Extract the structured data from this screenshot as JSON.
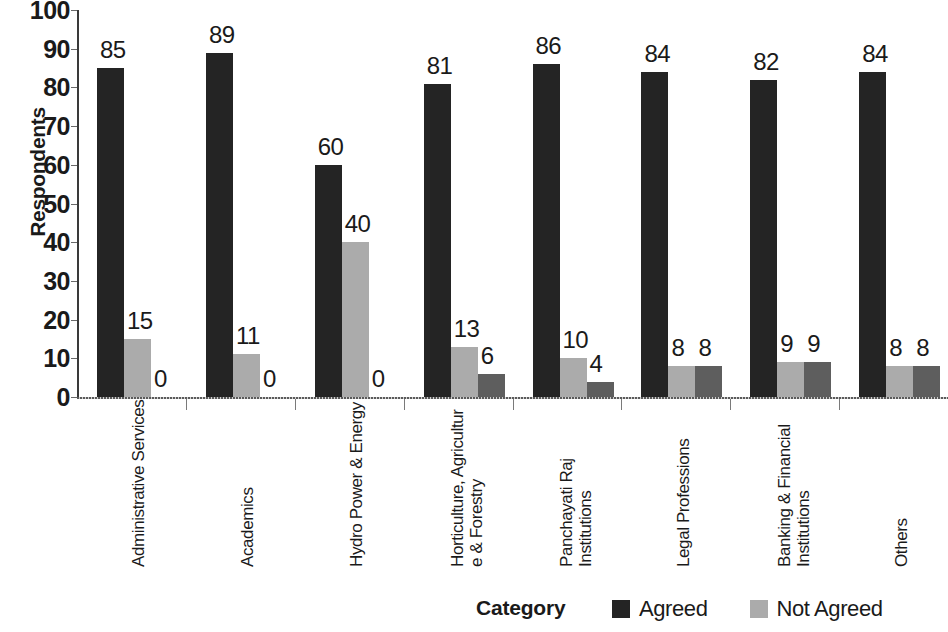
{
  "chart_data": {
    "type": "bar",
    "title": "",
    "xlabel": "Category",
    "ylabel": "Respondents",
    "ylim": [
      0,
      100
    ],
    "ytick_step": 10,
    "yticks": [
      100,
      90,
      80,
      70,
      60,
      50,
      40,
      30,
      20,
      10,
      0
    ],
    "grid": false,
    "legend_position": "bottom-right",
    "categories": [
      "Administrative Services",
      "Academics",
      "Hydro Power & Energy",
      "Horticulture, Agricultur\ne & Forestry",
      "Panchayati Raj\nInstitutions",
      "Legal Professions",
      "Banking & Financial\nInstitutions",
      "Others"
    ],
    "series": [
      {
        "name": "Agreed",
        "color": "#242424",
        "values": [
          85,
          89,
          60,
          81,
          86,
          84,
          82,
          84
        ],
        "labels": [
          "85",
          "89",
          "60",
          "81",
          "86",
          "84",
          "82",
          "84"
        ]
      },
      {
        "name": "Not Agreed",
        "color": "#ababab",
        "values": [
          15,
          11,
          40,
          13,
          10,
          8,
          9,
          8
        ],
        "labels": [
          "15",
          "11",
          "40",
          "13",
          "10",
          "8",
          "9",
          "8"
        ]
      },
      {
        "name": "",
        "color": "#5e5e5e",
        "values": [
          0,
          0,
          0,
          6,
          4,
          8,
          9,
          8
        ],
        "labels": [
          "0",
          "0",
          "0",
          "6",
          "4",
          "8",
          "9",
          "8"
        ]
      }
    ]
  },
  "legend": {
    "entries": [
      {
        "label": "Agreed",
        "color": "#242424"
      },
      {
        "label": "Not Agreed",
        "color": "#ababab"
      }
    ]
  },
  "axis": {
    "y_title": "Respondents",
    "x_title": "Category"
  }
}
